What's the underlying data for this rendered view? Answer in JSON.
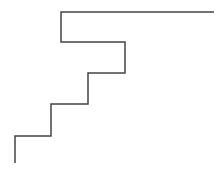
{
  "diagram": {
    "type": "staircase-line",
    "stroke_color": "#444444",
    "stroke_width": 1.5,
    "points": [
      [
        15,
        163
      ],
      [
        15,
        136
      ],
      [
        51,
        136
      ],
      [
        51,
        104
      ],
      [
        88,
        104
      ],
      [
        88,
        73
      ],
      [
        125,
        73
      ],
      [
        125,
        42
      ],
      [
        61,
        42
      ],
      [
        61,
        12
      ],
      [
        214,
        12
      ]
    ]
  }
}
